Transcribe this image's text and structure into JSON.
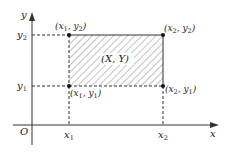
{
  "diagram": {
    "type": "coordinate-rectangle",
    "axes": {
      "x_label": "x",
      "y_label": "y",
      "origin_label": "O"
    },
    "ticks": {
      "x": [
        {
          "base": "x",
          "sub": "1"
        },
        {
          "base": "x",
          "sub": "2"
        }
      ],
      "y": [
        {
          "base": "y",
          "sub": "1"
        },
        {
          "base": "y",
          "sub": "2"
        }
      ]
    },
    "corners": {
      "top_left": {
        "text": "(x1, y2)",
        "x": "x",
        "xs": "1",
        "y": "y",
        "ys": "2"
      },
      "top_right": {
        "text": "(x2, y2)",
        "x": "x",
        "xs": "2",
        "y": "y",
        "ys": "2"
      },
      "bottom_left": {
        "text": "(x1, y1)",
        "x": "x",
        "xs": "1",
        "y": "y",
        "ys": "1"
      },
      "bottom_right": {
        "text": "(x2, y1)",
        "x": "x",
        "xs": "2",
        "y": "y",
        "ys": "1"
      }
    },
    "region_label": "(X, Y)",
    "colors": {
      "line": "#333333",
      "hatch": "#777777",
      "background": "#ffffff"
    }
  }
}
